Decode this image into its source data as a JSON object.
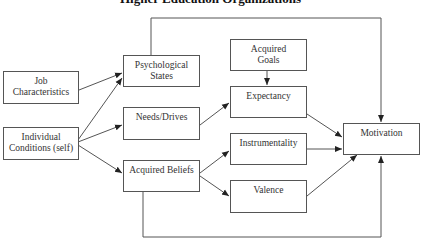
{
  "title": "Higher Education Organizations",
  "nodes": {
    "job": {
      "line1": "Job",
      "line2": "Characteristics"
    },
    "individual": {
      "line1": "Individual",
      "line2": "Conditions (self)"
    },
    "psych": {
      "line1": "Psychological",
      "line2": "States"
    },
    "needs": {
      "line1": "Needs/Drives"
    },
    "beliefs": {
      "line1": "Acquired Beliefs"
    },
    "goals": {
      "line1": "Acquired",
      "line2": "Goals"
    },
    "expectancy": {
      "line1": "Expectancy"
    },
    "instrumentality": {
      "line1": "Instrumentality"
    },
    "valence": {
      "line1": "Valence"
    },
    "motivation": {
      "line1": "Motivation"
    }
  },
  "edges": [
    {
      "from": "Job Characteristics",
      "to": "Psychological States"
    },
    {
      "from": "Individual Conditions (self)",
      "to": "Psychological States"
    },
    {
      "from": "Individual Conditions (self)",
      "to": "Needs/Drives"
    },
    {
      "from": "Individual Conditions (self)",
      "to": "Acquired Beliefs"
    },
    {
      "from": "Psychological States",
      "to": "Motivation"
    },
    {
      "from": "Needs/Drives",
      "to": "Expectancy"
    },
    {
      "from": "Acquired Goals",
      "to": "Expectancy"
    },
    {
      "from": "Acquired Beliefs",
      "to": "Instrumentality"
    },
    {
      "from": "Acquired Beliefs",
      "to": "Valence"
    },
    {
      "from": "Acquired Beliefs",
      "to": "Motivation"
    },
    {
      "from": "Expectancy",
      "to": "Motivation"
    },
    {
      "from": "Instrumentality",
      "to": "Motivation"
    },
    {
      "from": "Valence",
      "to": "Motivation"
    }
  ],
  "colors": {
    "line": "#555555",
    "text": "#333333",
    "background": "#ffffff"
  }
}
